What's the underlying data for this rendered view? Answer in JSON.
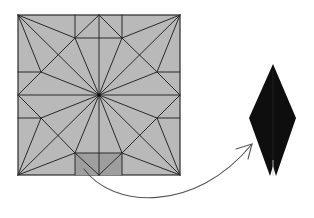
{
  "figure": {
    "colors": {
      "background": "#ffffff",
      "paper_fill": "#b8b8b8",
      "shaded_region": "#9c9c9c",
      "crease_line": "#2a2a2a",
      "folded_model": "#0d0d0d",
      "arrow": "#555555"
    },
    "crease_pattern": {
      "square": {
        "x": 18,
        "y": 15,
        "w": 162,
        "h": 160
      },
      "center": [
        99,
        95
      ],
      "shaded_rect": {
        "x": 75,
        "y": 153,
        "w": 47,
        "h": 22
      }
    },
    "folded_model": {
      "shape": "elongated diamond with split bottom tip",
      "points": [
        [
          273,
          64
        ],
        [
          296,
          118
        ],
        [
          275,
          176
        ],
        [
          271,
          176
        ],
        [
          249,
          118
        ]
      ]
    },
    "arrow": {
      "path": "M84 169 C 110 205, 190 215, 252 144",
      "direction": "from crease pattern to folded model"
    }
  }
}
